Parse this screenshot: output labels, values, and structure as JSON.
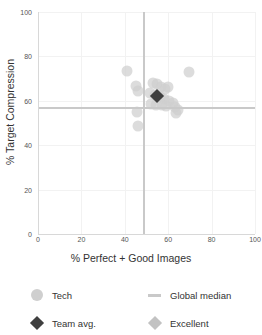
{
  "chart_data": {
    "type": "scatter",
    "title": "",
    "xlabel": "% Perfect + Good Images",
    "ylabel": "% Target Compression",
    "xlim": [
      0,
      100
    ],
    "ylim": [
      0,
      100
    ],
    "xticks": [
      0,
      20,
      40,
      60,
      80,
      100
    ],
    "yticks": [
      0,
      20,
      40,
      60,
      80,
      100
    ],
    "grid": true,
    "legend_position": "bottom",
    "series": [
      {
        "name": "Tech",
        "marker": "circle",
        "color": "#cfcfcf",
        "points": [
          {
            "x": 41.0,
            "y": 73.5
          },
          {
            "x": 69.5,
            "y": 73.0
          },
          {
            "x": 45.0,
            "y": 66.5
          },
          {
            "x": 46.0,
            "y": 64.5
          },
          {
            "x": 53.0,
            "y": 68.0
          },
          {
            "x": 55.0,
            "y": 67.5
          },
          {
            "x": 56.5,
            "y": 66.0
          },
          {
            "x": 58.5,
            "y": 65.5
          },
          {
            "x": 60.0,
            "y": 66.0
          },
          {
            "x": 51.5,
            "y": 63.5
          },
          {
            "x": 54.0,
            "y": 62.5
          },
          {
            "x": 56.0,
            "y": 61.5
          },
          {
            "x": 58.0,
            "y": 61.0
          },
          {
            "x": 60.5,
            "y": 60.0
          },
          {
            "x": 62.0,
            "y": 59.0
          },
          {
            "x": 52.0,
            "y": 58.5
          },
          {
            "x": 54.5,
            "y": 58.0
          },
          {
            "x": 57.0,
            "y": 58.0
          },
          {
            "x": 59.0,
            "y": 57.5
          },
          {
            "x": 63.0,
            "y": 57.0
          },
          {
            "x": 64.5,
            "y": 56.0
          },
          {
            "x": 45.5,
            "y": 55.0
          },
          {
            "x": 63.5,
            "y": 54.5
          },
          {
            "x": 46.0,
            "y": 48.5
          }
        ]
      }
    ],
    "reference_lines": [
      {
        "name": "Global median",
        "orientation": "vertical",
        "value": 48.5,
        "color": "#c9c9c9"
      },
      {
        "name": "Global median",
        "orientation": "horizontal",
        "value": 57.0,
        "color": "#c9c9c9"
      }
    ],
    "highlight_markers": [
      {
        "name": "Team avg.",
        "x": 55.0,
        "y": 62.0,
        "marker": "diamond",
        "color": "#3f3f3f"
      }
    ]
  },
  "axes": {
    "x_title": "% Perfect + Good Images",
    "y_title": "% Target Compression",
    "x_tick_labels": [
      "0",
      "20",
      "40",
      "60",
      "80",
      "100"
    ],
    "y_tick_labels": [
      "0",
      "20",
      "40",
      "60",
      "80",
      "100"
    ]
  },
  "legend": {
    "items": [
      {
        "label": "Tech",
        "marker": "circle",
        "color": "#cfcfcf"
      },
      {
        "label": "Global median",
        "marker": "line",
        "color": "#c9c9c9"
      },
      {
        "label": "Team avg.",
        "marker": "diamond",
        "color": "#3f3f3f"
      },
      {
        "label": "Excellent",
        "marker": "diamond",
        "color": "#c2c2c2"
      }
    ]
  },
  "colors": {
    "tech_marker": "#cfcfcf",
    "team_avg_marker": "#3f3f3f",
    "excellent_marker": "#c2c2c2",
    "median_line": "#c9c9c9",
    "gridline": "#f2f2f2",
    "axis": "#d8d8d8",
    "background": "#ffffff"
  }
}
